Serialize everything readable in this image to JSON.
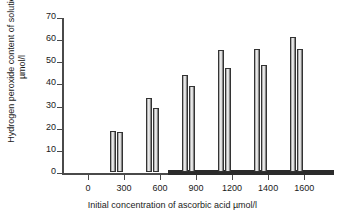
{
  "chart_data": {
    "type": "bar",
    "title": "",
    "xlabel": "Initial concentration of ascorbic acid µmol/l",
    "ylabel_line1": "Hydrogen peroxide content of solution",
    "ylabel_line2": "µmol/l",
    "categories": [
      "0",
      "300",
      "600",
      "900",
      "1200",
      "1400",
      "1600"
    ],
    "x_tick_labels": [
      "0",
      "300",
      "600",
      "900",
      "1200",
      "1400",
      "1600"
    ],
    "y_tick_labels": [
      "0",
      "10",
      "20",
      "30",
      "40",
      "50",
      "60",
      "70"
    ],
    "ylim": [
      0,
      70
    ],
    "y_tick_step": 10,
    "grid": false,
    "legend": "none",
    "series": [
      {
        "name": "series-1",
        "values": [
          0,
          18.5,
          33.5,
          44,
          55,
          55.5,
          61
        ]
      },
      {
        "name": "series-2",
        "values": [
          0,
          18,
          29,
          39,
          47,
          48.5,
          55.5
        ]
      }
    ]
  },
  "colors": {
    "axis": "#4a4a4a",
    "bar_outline": "#333333",
    "bar_fill_light": "#efefef",
    "bar_fill_dark": "#5e5e5e",
    "text": "#1a1a1a",
    "background": "#ffffff"
  }
}
